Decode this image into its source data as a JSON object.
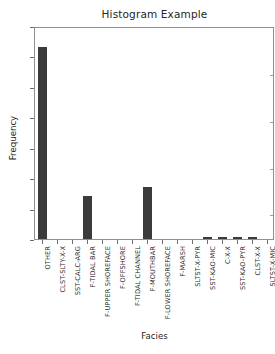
{
  "chart_data": {
    "type": "bar",
    "title": "Histogram Example",
    "xlabel": "Facies",
    "ylabel": "Frequency",
    "ylim": [
      0,
      1400
    ],
    "yticks": [
      0,
      200,
      400,
      600,
      800,
      1000,
      1200,
      1400
    ],
    "grid": false,
    "legend": null,
    "bar_color": "#3b3b3b",
    "categories": [
      "OTHER",
      "CLST-SLTY-X-X",
      "SST-CALC-ARG",
      "F-TIDAL BAR",
      "F-UPPER SHOREFACE",
      "F-OFFSHORE",
      "F-TIDAL CHANNEL",
      "F-MOUTHBAR",
      "F-LOWER SHOREFACE",
      "F-MARSH",
      "SLTST-X-PYR",
      "SST-KAO-MIC",
      "C-X-X",
      "SST-KAO-PYR",
      "CLST-X-X",
      "SLTST-X-MIC"
    ],
    "values": [
      1265,
      0,
      0,
      283,
      0,
      0,
      0,
      340,
      0,
      0,
      0,
      14,
      14,
      14,
      14,
      0
    ]
  }
}
